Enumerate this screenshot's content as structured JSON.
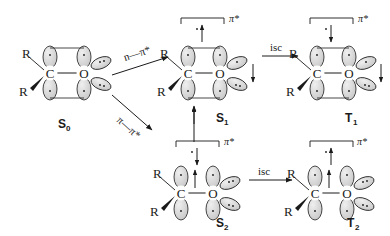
{
  "diagram": {
    "atoms": {
      "carbon": "C",
      "oxygen": "O",
      "substituent": "R"
    },
    "colors": {
      "stroke": "#1a1a1a",
      "lobe_fill": "#d0d0d0",
      "lobe_empty": "#ffffff",
      "background": "#ffffff"
    }
  },
  "states": {
    "s0": {
      "label": "S",
      "sub": "0",
      "r_top": "R",
      "r_bottom": "R",
      "carbon": "C",
      "oxygen": "O",
      "pi_star_label": "",
      "pi_star_arrow": "",
      "pi_arrow": "",
      "n_arrow": "",
      "bracket": false,
      "lone_pairs": 2,
      "description": "ground state, pi bond filled, no bracket"
    },
    "s1": {
      "label": "S",
      "sub": "1",
      "r_top": "R",
      "r_bottom": "R",
      "carbon": "C",
      "oxygen": "O",
      "pi_star_label": "π*",
      "pi_star_arrow": "up",
      "pi_arrow": "up",
      "n_arrow": "down",
      "bracket": true,
      "lone_pairs": 2,
      "description": "n,pi* singlet"
    },
    "t1": {
      "label": "T",
      "sub": "1",
      "r_top": "R",
      "r_bottom": "R",
      "carbon": "C",
      "oxygen": "O",
      "pi_star_label": "π*",
      "pi_star_arrow": "down",
      "pi_arrow": "",
      "n_arrow": "down",
      "bracket": true,
      "lone_pairs": 2,
      "description": "n,pi* triplet"
    },
    "s2": {
      "label": "S",
      "sub": "2",
      "r_top": "R",
      "r_bottom": "R",
      "carbon": "C",
      "oxygen": "O",
      "pi_star_label": "π*",
      "pi_star_arrow": "down",
      "pi_arrow": "up",
      "n_arrow": "",
      "bracket": true,
      "lone_pairs": 2,
      "description": "pi,pi* singlet"
    },
    "t2": {
      "label": "T",
      "sub": "2",
      "r_top": "R",
      "r_bottom": "R",
      "carbon": "C",
      "oxygen": "O",
      "pi_star_label": "π*",
      "pi_star_arrow": "up",
      "pi_arrow": "up",
      "n_arrow": "",
      "bracket": true,
      "lone_pairs": 2,
      "description": "pi,pi* triplet"
    }
  },
  "transitions": {
    "n_to_pistar": "n—π*",
    "pi_to_pistar": "π—π*",
    "isc_top": "isc",
    "isc_bottom": "isc",
    "ic_vertical": ""
  }
}
